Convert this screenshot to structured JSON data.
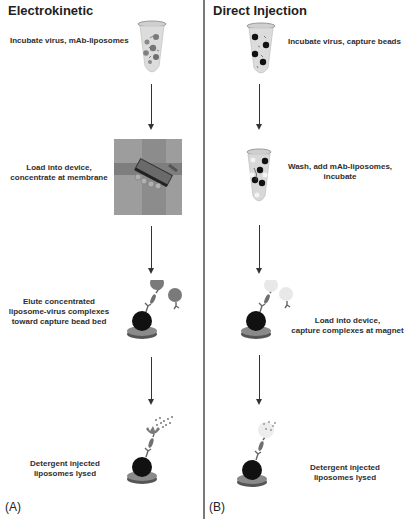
{
  "panels": [
    {
      "id": "A",
      "title": "Electrokinetic",
      "label": "(A)",
      "steps": [
        {
          "text": "Incubate virus, mAb-liposomes",
          "icon": "tube-liposomes-icon"
        },
        {
          "text_lines": [
            "Load into device,",
            "concentrate at membrane"
          ],
          "icon": "device-membrane-icon"
        },
        {
          "text_lines": [
            "Elute concentrated",
            "liposome-virus complexes",
            "toward capture bead bed"
          ],
          "icon": "capture-bead-complex-icon"
        },
        {
          "text_lines": [
            "Detergent injected",
            "liposomes lysed"
          ],
          "icon": "lysed-liposome-icon"
        }
      ]
    },
    {
      "id": "B",
      "title": "Direct Injection",
      "label": "(B)",
      "steps": [
        {
          "text": "Incubate virus, capture beads",
          "icon": "tube-beads-icon"
        },
        {
          "text_lines": [
            "Wash, add mAb-liposomes,",
            "incubate"
          ],
          "icon": "tube-wash-icon"
        },
        {
          "text_lines": [
            "Load into device,",
            "capture complexes at magnet"
          ],
          "icon": "magnet-capture-icon"
        },
        {
          "text_lines": [
            "Detergent injected",
            "liposomes lysed"
          ],
          "icon": "lysed-liposome-icon"
        }
      ]
    }
  ],
  "colors": {
    "text": "#2a2a2a",
    "divider": "#7a7a7a",
    "bead": "#111111",
    "liposome": "#7a7a7a",
    "liposome_light": "#e6e6e6",
    "device": "#9a9a9a"
  }
}
